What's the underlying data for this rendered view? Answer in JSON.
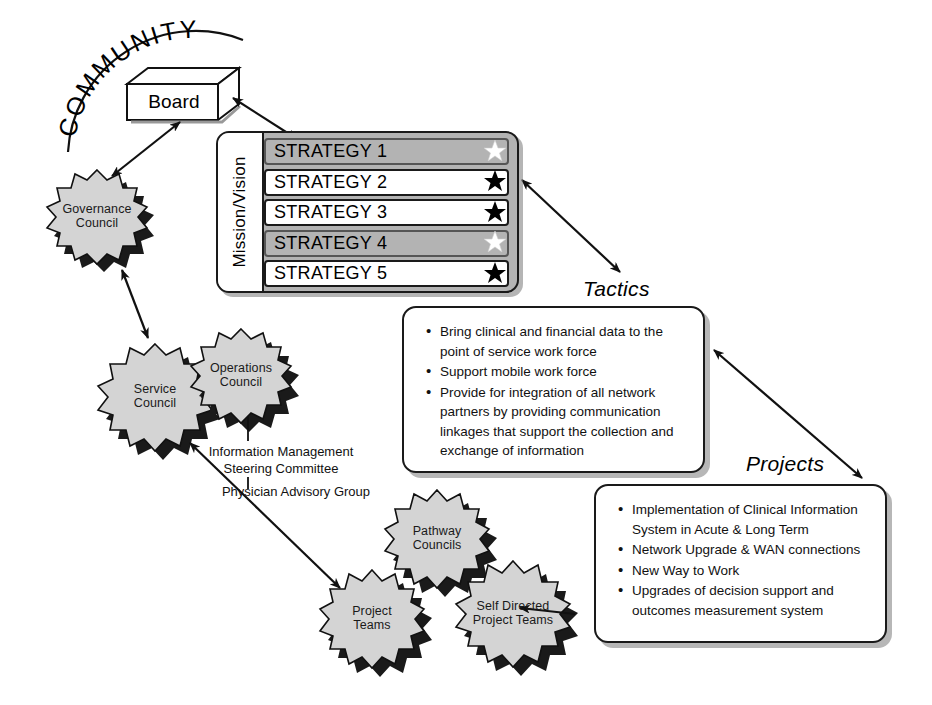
{
  "diagram": {
    "title_arc": "COMMUNITY",
    "board": {
      "label": "Board"
    },
    "strategy_panel": {
      "side_label": "Mission/Vision",
      "panel_color": "#b3b3b3",
      "rows": [
        {
          "label": "STRATEGY 1",
          "style": "shaded",
          "star": "white"
        },
        {
          "label": "STRATEGY 2",
          "style": "plain",
          "star": "black"
        },
        {
          "label": "STRATEGY 3",
          "style": "plain",
          "star": "black"
        },
        {
          "label": "STRATEGY 4",
          "style": "shaded",
          "star": "white"
        },
        {
          "label": "STRATEGY 5",
          "style": "plain",
          "star": "black"
        }
      ]
    },
    "captions": {
      "tactics": "Tactics",
      "projects": "Projects"
    },
    "tactics_box": {
      "bullets": [
        "Bring clinical and financial data to the point of service work force",
        "Support mobile work force",
        "Provide for integration of all network partners by providing communication linkages that support the collection and exchange of information"
      ]
    },
    "projects_box": {
      "bullets": [
        "Implementation of Clinical Information System in Acute & Long Term",
        "Network Upgrade & WAN connections",
        "New Way to Work",
        "Upgrades of decision support and outcomes measurement system"
      ]
    },
    "bursts": [
      {
        "id": "governance-council",
        "line1": "Governance",
        "line2": "Council"
      },
      {
        "id": "service-council",
        "line1": "Service",
        "line2": "Council"
      },
      {
        "id": "operations-council",
        "line1": "Operations",
        "line2": "Council"
      },
      {
        "id": "pathway-councils",
        "line1": "Pathway",
        "line2": "Councils"
      },
      {
        "id": "project-teams",
        "line1": "Project",
        "line2": "Teams"
      },
      {
        "id": "self-directed-teams",
        "line1": "Self Directed",
        "line2": "Project Teams"
      }
    ],
    "committees": {
      "imsc_line1": "Information Management",
      "imsc_line2": "Steering Committee",
      "pag": "Physician Advisory Group"
    },
    "colors": {
      "burst_fill": "#d4d4d4",
      "burst_shadow": "#1a1a1a",
      "panel_gray": "#b3b3b3",
      "line": "#111111"
    }
  }
}
